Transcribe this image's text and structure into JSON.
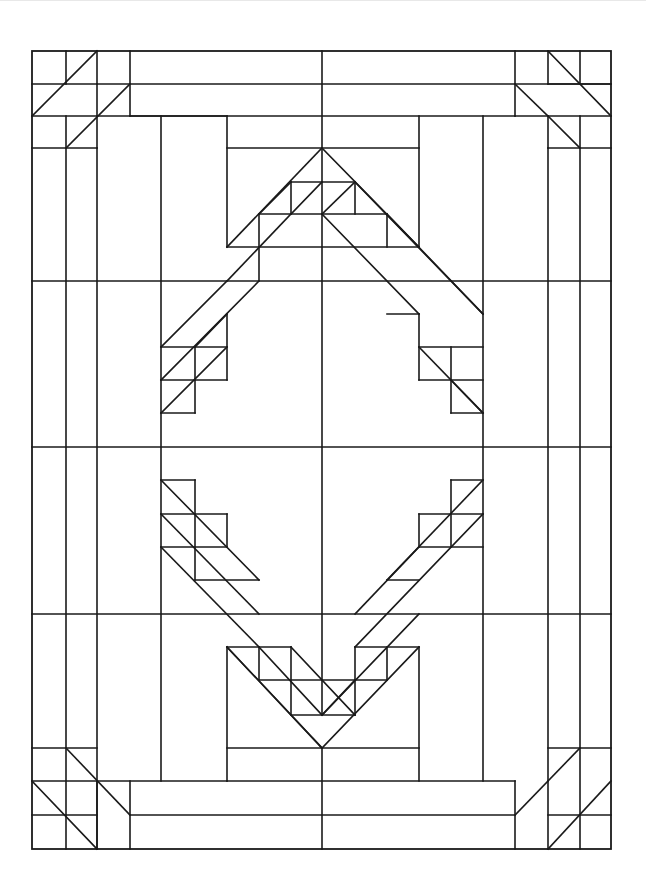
{
  "diagram": {
    "type": "quilt-pattern-line-art",
    "colors": {
      "line": "#1a1a1a",
      "background": "#ffffff"
    },
    "border": {
      "x": 32,
      "y": 51,
      "w": 579,
      "h": 798
    },
    "segments": [
      [
        32,
        84,
        97,
        84
      ],
      [
        32,
        116,
        227,
        116
      ],
      [
        32,
        148,
        97,
        148
      ],
      [
        97,
        84,
        611,
        84
      ],
      [
        130,
        116,
        515,
        116
      ],
      [
        66,
        51,
        66,
        84
      ],
      [
        97,
        51,
        97,
        148
      ],
      [
        130,
        51,
        130,
        116
      ],
      [
        32,
        116,
        97,
        51
      ],
      [
        66,
        148,
        130,
        84
      ],
      [
        66,
        116,
        66,
        849
      ],
      [
        97,
        148,
        97,
        849
      ],
      [
        161,
        116,
        161,
        781
      ],
      [
        322,
        51,
        322,
        182
      ],
      [
        227,
        116,
        227,
        247
      ],
      [
        419,
        116,
        419,
        247
      ],
      [
        227,
        148,
        419,
        148
      ],
      [
        515,
        51,
        515,
        116
      ],
      [
        548,
        51,
        548,
        84
      ],
      [
        548,
        116,
        548,
        148
      ],
      [
        548,
        84,
        611,
        84
      ],
      [
        548,
        148,
        611,
        148
      ],
      [
        515,
        116,
        611,
        116
      ],
      [
        548,
        51,
        611,
        116
      ],
      [
        515,
        84,
        548,
        116
      ],
      [
        548,
        116,
        580,
        148
      ],
      [
        580,
        51,
        580,
        84
      ],
      [
        580,
        116,
        580,
        849
      ],
      [
        548,
        148,
        548,
        781
      ],
      [
        483,
        116,
        483,
        781
      ],
      [
        32,
        281,
        611,
        281
      ],
      [
        32,
        447,
        611,
        447
      ],
      [
        32,
        614,
        611,
        614
      ],
      [
        32,
        748,
        97,
        748
      ],
      [
        32,
        781,
        227,
        781
      ],
      [
        32,
        815,
        97,
        815
      ],
      [
        97,
        781,
        97,
        849
      ],
      [
        130,
        781,
        130,
        849
      ],
      [
        130,
        815,
        515,
        815
      ],
      [
        227,
        781,
        515,
        781
      ],
      [
        32,
        781,
        97,
        849
      ],
      [
        66,
        748,
        130,
        815
      ],
      [
        548,
        748,
        611,
        748
      ],
      [
        548,
        815,
        611,
        815
      ],
      [
        515,
        781,
        515,
        849
      ],
      [
        548,
        781,
        548,
        849
      ],
      [
        548,
        849,
        611,
        781
      ],
      [
        515,
        815,
        580,
        748
      ],
      [
        227,
        647,
        227,
        781
      ],
      [
        419,
        647,
        419,
        781
      ],
      [
        227,
        748,
        419,
        748
      ],
      [
        322,
        748,
        322,
        849
      ],
      [
        322,
        148,
        227,
        247
      ],
      [
        322,
        148,
        419,
        247
      ],
      [
        322,
        182,
        322,
        715
      ],
      [
        259,
        214,
        291,
        182
      ],
      [
        291,
        182,
        355,
        182
      ],
      [
        259,
        214,
        387,
        214
      ],
      [
        259,
        214,
        259,
        247
      ],
      [
        291,
        182,
        291,
        214
      ],
      [
        355,
        182,
        355,
        214
      ],
      [
        387,
        214,
        387,
        247
      ],
      [
        227,
        247,
        419,
        247
      ],
      [
        291,
        214,
        322,
        182
      ],
      [
        322,
        214,
        355,
        182
      ],
      [
        291,
        214,
        227,
        281
      ],
      [
        322,
        214,
        419,
        314
      ],
      [
        355,
        182,
        483,
        314
      ],
      [
        387,
        214,
        483,
        314
      ],
      [
        227,
        281,
        161,
        347
      ],
      [
        259,
        281,
        161,
        380
      ],
      [
        259,
        247,
        259,
        281
      ],
      [
        161,
        347,
        227,
        347
      ],
      [
        161,
        380,
        227,
        380
      ],
      [
        161,
        413,
        195,
        413
      ],
      [
        195,
        347,
        195,
        413
      ],
      [
        227,
        314,
        227,
        380
      ],
      [
        195,
        347,
        227,
        314
      ],
      [
        161,
        413,
        227,
        347
      ],
      [
        387,
        314,
        419,
        314
      ],
      [
        419,
        314,
        419,
        380
      ],
      [
        419,
        347,
        483,
        347
      ],
      [
        419,
        380,
        483,
        380
      ],
      [
        451,
        380,
        483,
        413
      ],
      [
        419,
        347,
        483,
        413
      ],
      [
        451,
        347,
        451,
        413
      ],
      [
        451,
        413,
        483,
        413
      ],
      [
        161,
        480,
        195,
        480
      ],
      [
        161,
        514,
        227,
        514
      ],
      [
        161,
        547,
        227,
        547
      ],
      [
        195,
        480,
        195,
        580
      ],
      [
        227,
        514,
        227,
        547
      ],
      [
        161,
        480,
        259,
        580
      ],
      [
        161,
        514,
        259,
        614
      ],
      [
        161,
        547,
        259,
        647
      ],
      [
        195,
        580,
        259,
        580
      ],
      [
        451,
        480,
        483,
        480
      ],
      [
        419,
        514,
        483,
        514
      ],
      [
        419,
        547,
        483,
        547
      ],
      [
        451,
        480,
        451,
        547
      ],
      [
        419,
        514,
        419,
        547
      ],
      [
        483,
        480,
        387,
        580
      ],
      [
        483,
        514,
        355,
        647
      ],
      [
        419,
        547,
        355,
        614
      ],
      [
        387,
        580,
        419,
        580
      ],
      [
        227,
        647,
        322,
        748
      ],
      [
        259,
        647,
        322,
        715
      ],
      [
        322,
        715,
        419,
        614
      ],
      [
        322,
        748,
        419,
        647
      ],
      [
        227,
        647,
        291,
        647
      ],
      [
        259,
        680,
        387,
        680
      ],
      [
        291,
        715,
        355,
        715
      ],
      [
        259,
        647,
        259,
        680
      ],
      [
        291,
        647,
        291,
        715
      ],
      [
        355,
        647,
        355,
        715
      ],
      [
        387,
        647,
        387,
        680
      ],
      [
        355,
        647,
        419,
        647
      ],
      [
        227,
        647,
        322,
        748
      ],
      [
        291,
        647,
        355,
        715
      ],
      [
        322,
        715,
        355,
        680
      ]
    ]
  }
}
